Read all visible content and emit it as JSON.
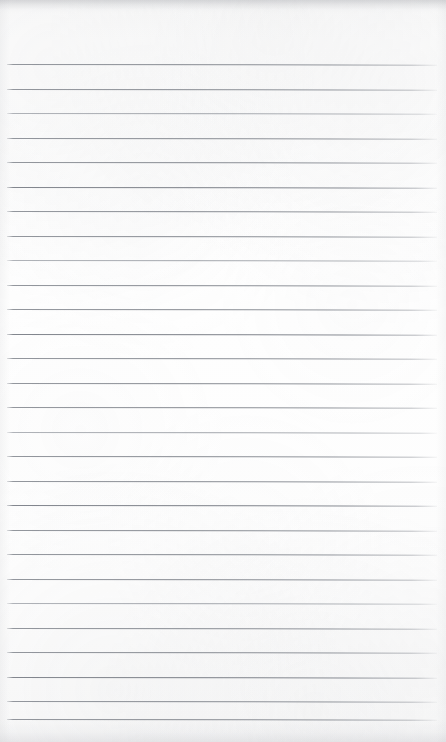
{
  "document": {
    "kind": "scanned-ruled-notebook-page",
    "title": "Blank Ruled Notebook Page",
    "page_width": 446,
    "page_height": 742,
    "background_color": "#fdfdfd",
    "has_text_content": false,
    "has_handwriting": false,
    "is_blank": true,
    "body_text": ""
  },
  "paper": {
    "tone_color": "#fdfdfd",
    "top_edge_shadow_color": "#94969b",
    "bottom_edge_shadow_color": "#989a9f",
    "texture_color": "#aaacb0"
  },
  "header_zone": {
    "label": "Unruled header area",
    "top": 0,
    "height": 64
  },
  "ruling": {
    "style": "wide-ruled horizontal lines",
    "line_color": "#868a91",
    "line_thickness_px": 1,
    "line_spacing_px": 24.5,
    "first_line_y": 64,
    "last_line_y": 719,
    "line_left_x": 7,
    "line_right_x": 437,
    "line_count": 28,
    "skew_degrees": 0.085,
    "has_vertical_margin_rule": false,
    "lines": [
      {
        "index": 1,
        "y": 64.0,
        "weight": "normal"
      },
      {
        "index": 2,
        "y": 88.5,
        "weight": "normal"
      },
      {
        "index": 3,
        "y": 113.0,
        "weight": "lighter"
      },
      {
        "index": 4,
        "y": 137.5,
        "weight": "normal"
      },
      {
        "index": 5,
        "y": 162.0,
        "weight": "normal"
      },
      {
        "index": 6,
        "y": 186.5,
        "weight": "heavier"
      },
      {
        "index": 7,
        "y": 211.0,
        "weight": "normal"
      },
      {
        "index": 8,
        "y": 235.5,
        "weight": "normal"
      },
      {
        "index": 9,
        "y": 260.0,
        "weight": "lighter"
      },
      {
        "index": 10,
        "y": 284.5,
        "weight": "normal"
      },
      {
        "index": 11,
        "y": 309.0,
        "weight": "normal"
      },
      {
        "index": 12,
        "y": 333.5,
        "weight": "heavier"
      },
      {
        "index": 13,
        "y": 358.0,
        "weight": "normal"
      },
      {
        "index": 14,
        "y": 382.5,
        "weight": "normal"
      },
      {
        "index": 15,
        "y": 407.0,
        "weight": "normal"
      },
      {
        "index": 16,
        "y": 431.5,
        "weight": "lighter"
      },
      {
        "index": 17,
        "y": 456.0,
        "weight": "normal"
      },
      {
        "index": 18,
        "y": 480.5,
        "weight": "normal"
      },
      {
        "index": 19,
        "y": 505.0,
        "weight": "heavier"
      },
      {
        "index": 20,
        "y": 529.5,
        "weight": "normal"
      },
      {
        "index": 21,
        "y": 554.0,
        "weight": "normal"
      },
      {
        "index": 22,
        "y": 578.5,
        "weight": "normal"
      },
      {
        "index": 23,
        "y": 603.0,
        "weight": "lighter"
      },
      {
        "index": 24,
        "y": 627.5,
        "weight": "normal"
      },
      {
        "index": 25,
        "y": 652.0,
        "weight": "normal"
      },
      {
        "index": 26,
        "y": 676.5,
        "weight": "heavier"
      },
      {
        "index": 27,
        "y": 701.0,
        "weight": "normal"
      },
      {
        "index": 28,
        "y": 719.0,
        "weight": "normal"
      }
    ]
  }
}
